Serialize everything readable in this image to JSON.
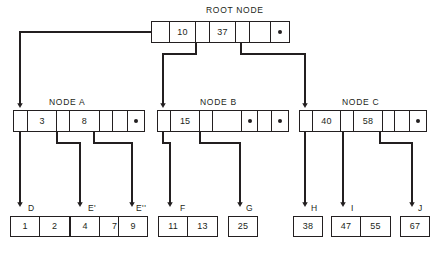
{
  "diagram": {
    "root": {
      "label": "ROOT NODE",
      "cells": [
        {
          "type": "ptr",
          "value": ""
        },
        {
          "type": "key",
          "value": "10"
        },
        {
          "type": "ptr",
          "value": ""
        },
        {
          "type": "key",
          "value": "37"
        },
        {
          "type": "ptr",
          "value": ""
        },
        {
          "type": "key",
          "value": ""
        },
        {
          "type": "null",
          "value": "●"
        }
      ]
    },
    "internal_nodes": [
      {
        "label": "NODE A",
        "cells": [
          {
            "type": "ptr",
            "value": ""
          },
          {
            "type": "key",
            "value": "3"
          },
          {
            "type": "ptr",
            "value": ""
          },
          {
            "type": "key",
            "value": "8"
          },
          {
            "type": "ptr",
            "value": ""
          },
          {
            "type": "key",
            "value": ""
          },
          {
            "type": "null",
            "value": "●"
          }
        ]
      },
      {
        "label": "NODE B",
        "cells": [
          {
            "type": "ptr",
            "value": ""
          },
          {
            "type": "key",
            "value": "15"
          },
          {
            "type": "ptr",
            "value": ""
          },
          {
            "type": "key",
            "value": ""
          },
          {
            "type": "null",
            "value": "●"
          },
          {
            "type": "key",
            "value": ""
          },
          {
            "type": "null",
            "value": "●"
          }
        ]
      },
      {
        "label": "NODE C",
        "cells": [
          {
            "type": "ptr",
            "value": ""
          },
          {
            "type": "key",
            "value": "40"
          },
          {
            "type": "ptr",
            "value": ""
          },
          {
            "type": "key",
            "value": "58"
          },
          {
            "type": "ptr",
            "value": ""
          },
          {
            "type": "key",
            "value": ""
          },
          {
            "type": "null",
            "value": "●"
          }
        ]
      }
    ],
    "leaf_nodes": [
      {
        "label": "D",
        "values": [
          "1",
          "2"
        ]
      },
      {
        "label": "E'",
        "values": [
          "4",
          "7"
        ]
      },
      {
        "label": "E''",
        "values": [
          "9"
        ]
      },
      {
        "label": "F",
        "values": [
          "11",
          "13"
        ]
      },
      {
        "label": "G",
        "values": [
          "25"
        ]
      },
      {
        "label": "H",
        "values": [
          "38"
        ]
      },
      {
        "label": "I",
        "values": [
          "47",
          "55"
        ]
      },
      {
        "label": "J",
        "values": [
          "67"
        ]
      }
    ],
    "colors": {
      "line": "#231f20",
      "text": "#231f20",
      "background": "#ffffff"
    }
  }
}
